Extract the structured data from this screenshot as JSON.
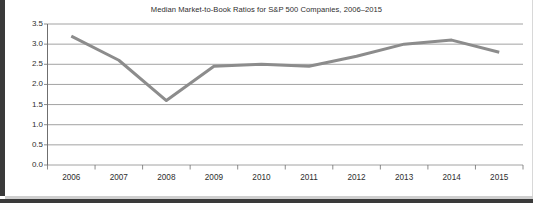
{
  "chart_data": {
    "type": "line",
    "title": "Median Market-to-Book Ratios for S&P 500 Companies, 2006–2015",
    "xlabel": "",
    "ylabel": "",
    "categories": [
      "2006",
      "2007",
      "2008",
      "2009",
      "2010",
      "2011",
      "2012",
      "2013",
      "2014",
      "2015"
    ],
    "x": [
      2006,
      2007,
      2008,
      2009,
      2010,
      2011,
      2012,
      2013,
      2014,
      2015
    ],
    "values": [
      3.2,
      2.6,
      1.6,
      2.45,
      2.5,
      2.45,
      2.7,
      3.0,
      3.1,
      2.8
    ],
    "series": [
      {
        "name": "Median market-to-book ratio",
        "values": [
          3.2,
          2.6,
          1.6,
          2.45,
          2.5,
          2.45,
          2.7,
          3.0,
          3.1,
          2.8
        ],
        "color": "#8c8c8c"
      }
    ],
    "ylim": [
      0.0,
      3.5
    ],
    "yticks": [
      0.0,
      0.5,
      1.0,
      1.5,
      2.0,
      2.5,
      3.0,
      3.5
    ],
    "ytick_labels": [
      "0.0",
      "0.5",
      "1.0",
      "1.5",
      "2.0",
      "2.5",
      "3.0",
      "3.5"
    ],
    "xtick_labels": [
      "2006",
      "2007",
      "2008",
      "2009",
      "2010",
      "2011",
      "2012",
      "2013",
      "2014",
      "2015"
    ],
    "grid": "horizontal",
    "legend": "none",
    "markers": "none",
    "line_width": 3,
    "annotations": []
  },
  "colors": {
    "line": "#8c8c8c",
    "gridline": "#8a8a8a",
    "axis": "#6f6f6f",
    "text": "#2e2e2e",
    "background": "#ffffff",
    "frame": "#3a3a3a"
  }
}
